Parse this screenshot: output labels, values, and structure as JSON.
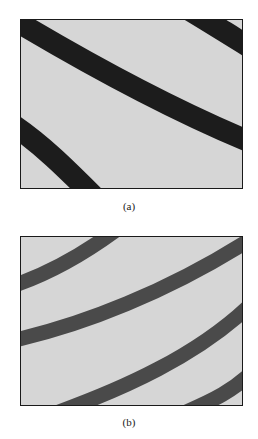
{
  "figure": {
    "panels": [
      {
        "id": "a",
        "caption": "(a)",
        "background": "#d6d6d6",
        "band_color": "#1c1c1c",
        "band_width": 22,
        "bands": [
          "M -10 -2 C 60 40, 150 90, 235 125",
          "M 170 -10 C 195 5, 215 18, 235 30",
          "M -10 105 C 20 125, 45 150, 75 180"
        ]
      },
      {
        "id": "b",
        "caption": "(b)",
        "background": "#d6d6d6",
        "band_color": "#4a4a4a",
        "band_width": 15,
        "bands": [
          "M -10 50 C 20 40, 60 20, 100 -10",
          "M -10 105 C 60 90, 150 55, 235 0",
          "M 30 180 C 100 155, 180 120, 235 65",
          "M 160 180 C 195 165, 215 155, 235 135"
        ]
      }
    ]
  }
}
